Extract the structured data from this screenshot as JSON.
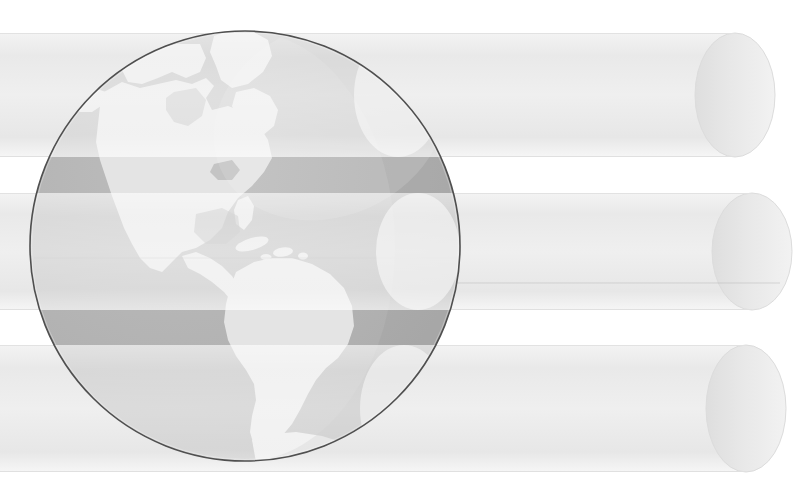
{
  "graphic": {
    "title": "Globe with three horizontal cylindrical bars",
    "kind": "illustration",
    "canvas": {
      "width": 805,
      "height": 498,
      "background": "#ffffff"
    }
  },
  "globe": {
    "name": "earth-globe",
    "region_shown": "Americas",
    "center_x": 245,
    "center_y": 246,
    "radius": 216,
    "ocean_color": "#b0b0b0",
    "land_color": "#e2e2e2",
    "land_shadow_color": "#a8a8a8",
    "outline_color": "#4a4a4a",
    "highlight_color": "#d6d6d6",
    "landmasses": [
      {
        "name": "north-america",
        "label": "North America"
      },
      {
        "name": "greenland",
        "label": "Greenland"
      },
      {
        "name": "central-america",
        "label": "Central America"
      },
      {
        "name": "caribbean-islands",
        "label": "Caribbean Islands"
      },
      {
        "name": "south-america",
        "label": "South America"
      },
      {
        "name": "antarctic-rim",
        "label": "Antarctic Rim"
      }
    ]
  },
  "bars": {
    "name": "cylinder-bar-group",
    "count": 3,
    "body_color": "#ededed",
    "cap_color": "#e4e4e4",
    "edge_color": "#cfcfcf",
    "items": [
      {
        "name": "cylinder-bar-1",
        "label": "Bar 1",
        "top": 33,
        "bottom": 157,
        "right": 775,
        "height": 124
      },
      {
        "name": "cylinder-bar-2",
        "label": "Bar 2",
        "top": 193,
        "bottom": 310,
        "right": 792,
        "height": 117
      },
      {
        "name": "cylinder-bar-3",
        "label": "Bar 3",
        "top": 345,
        "bottom": 472,
        "right": 786,
        "height": 127
      }
    ]
  },
  "palette": {
    "background": "#ffffff",
    "ocean": "#b0b0b0",
    "land": "#e2e2e2",
    "bar": "#ededed",
    "outline": "#4a4a4a"
  }
}
